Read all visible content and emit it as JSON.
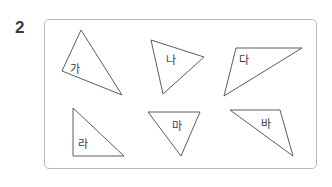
{
  "problem": {
    "number": "2"
  },
  "figure": {
    "stroke_color": "#4a4a4a",
    "border_color": "#b8b8b8",
    "triangles": [
      {
        "label": "가",
        "points": "81,30 62,71 122,95",
        "label_x": 70,
        "label_y": 73
      },
      {
        "label": "나",
        "points": "151,40 204,57 163,94",
        "label_x": 166,
        "label_y": 64
      },
      {
        "label": "다",
        "points": "236,48 302,48 224,96",
        "label_x": 239,
        "label_y": 64
      },
      {
        "label": "라",
        "points": "73,108 73,156 124,156",
        "label_x": 78,
        "label_y": 148
      },
      {
        "label": "마",
        "points": "148,112 200,112 181,156",
        "label_x": 172,
        "label_y": 130
      },
      {
        "label": "바",
        "points": "230,110 280,110 293,156",
        "label_x": 261,
        "label_y": 128
      }
    ]
  }
}
